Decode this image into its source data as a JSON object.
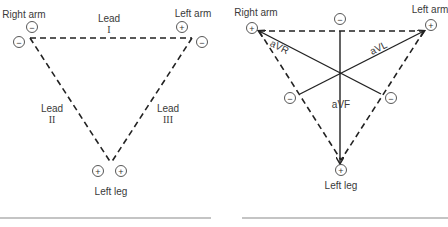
{
  "left_diagram": {
    "title": "Einthoven triangle - bipolar limb leads",
    "labels": {
      "right_arm": "Right arm",
      "left_arm": "Left arm",
      "left_leg": "Left leg",
      "lead_word": "Lead",
      "lead_I": "I",
      "lead_II": "II",
      "lead_III": "III"
    },
    "signs": {
      "ra_top": "−",
      "ra_outer": "−",
      "la_top": "+",
      "la_outer": "−",
      "ll_left": "+",
      "ll_right": "+"
    }
  },
  "right_diagram": {
    "title": "Augmented unipolar limb leads",
    "labels": {
      "right_arm": "Right arm",
      "left_arm": "Left arm",
      "left_leg": "Left leg",
      "aVR": "aVR",
      "aVL": "aVL",
      "aVF": "aVF"
    },
    "signs": {
      "ra": "+",
      "la": "+",
      "top": "−",
      "lower_left": "−",
      "lower_right": "−",
      "ll": "+"
    }
  }
}
